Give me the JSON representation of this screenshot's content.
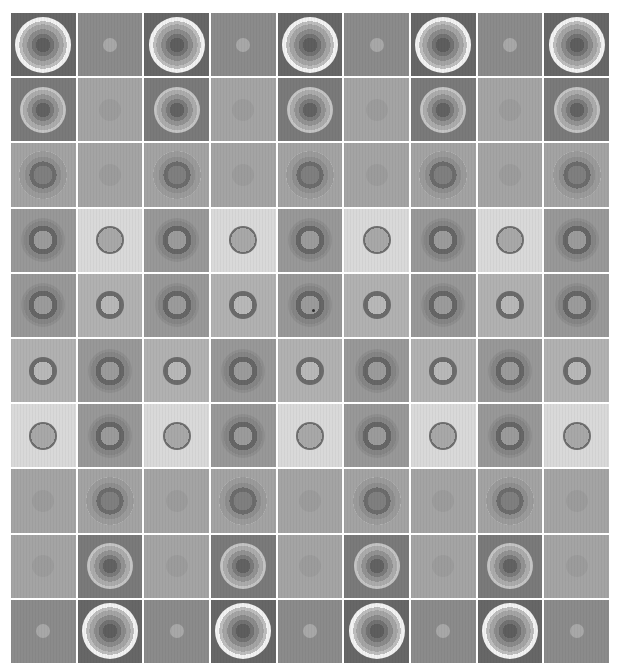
{
  "grid": {
    "columns": 9,
    "rows": 10,
    "description": "Grayscale concentric-circle stimulus sheet",
    "cell_types": {
      "big_ring": {
        "bg": "#676767",
        "size": 56,
        "gradient": "radial-gradient(circle, #5e5e5e 0 18%, #727272 18% 28%, #8a8a8a 28% 40%, #a4a4a4 40% 52%, #bdbdbd 52% 60%, #f2f2f2 60% 76%, #c6c6c6 76% 88%, #a9a9a9 88% 100%)"
      },
      "white_ring": {
        "bg": "#7a7a7a",
        "size": 46,
        "gradient": "radial-gradient(circle, #626262 0 22%, #7a7a7a 22% 34%, #929292 34% 48%, #ababab 48% 62%, #c4c4c4 62% 74%, #f4f4f4 74% 100%)"
      },
      "faint_halo_ring": {
        "bg": "#a3a3a3",
        "size": 48,
        "gradient": "radial-gradient(circle, #7f7f7f 0 28%, #6c6c6c 28% 40%, #8e8e8e 40% 54%, #9a9a9a 54% 70%, #bdbdbd 70% 82%, #acacac 82% 100%)"
      },
      "soft_halo_ring": {
        "bg": "#989898",
        "size": 44,
        "gradient": "radial-gradient(circle, #9b9b9b 0 30%, #666666 30% 46%, #858585 46% 62%, #8e8e8e 62% 80%, #949494 80% 100%)"
      },
      "light_bg_ring": {
        "bg": "#d9d9d9",
        "size": 28,
        "gradient": "radial-gradient(circle, #a8a8a8 0 60%, #6e6e6e 60% 100%)"
      },
      "mid_bg_ring": {
        "bg": "#b1b1b1",
        "size": 28,
        "gradient": "radial-gradient(circle, #b8b8b8 0 48%, #6b6b6b 48% 80%, #5e5e5e 80% 100%)"
      },
      "faint_striped_circle": {
        "bg": "#a4a4a4",
        "size": 22,
        "gradient": "radial-gradient(circle, #9c9c9c 0 80%, #949494 80% 100%)"
      },
      "small_dot": {
        "bg": "#8b8b8b",
        "size": 14,
        "gradient": "radial-gradient(circle, #a8a8a8 0 100%)"
      }
    },
    "rows_data": [
      [
        "big_ring",
        "small_dot",
        "big_ring",
        "small_dot",
        "big_ring",
        "small_dot",
        "big_ring",
        "small_dot",
        "big_ring"
      ],
      [
        "white_ring",
        "faint_striped_circle",
        "white_ring",
        "faint_striped_circle",
        "white_ring",
        "faint_striped_circle",
        "white_ring",
        "faint_striped_circle",
        "white_ring"
      ],
      [
        "faint_halo_ring",
        "faint_striped_circle",
        "faint_halo_ring",
        "faint_striped_circle",
        "faint_halo_ring",
        "faint_striped_circle",
        "faint_halo_ring",
        "faint_striped_circle",
        "faint_halo_ring"
      ],
      [
        "soft_halo_ring",
        "light_bg_ring",
        "soft_halo_ring",
        "light_bg_ring",
        "soft_halo_ring",
        "light_bg_ring",
        "soft_halo_ring",
        "light_bg_ring",
        "soft_halo_ring"
      ],
      [
        "soft_halo_ring",
        "mid_bg_ring",
        "soft_halo_ring",
        "mid_bg_ring",
        "soft_halo_ring",
        "mid_bg_ring",
        "soft_halo_ring",
        "mid_bg_ring",
        "soft_halo_ring"
      ],
      [
        "mid_bg_ring",
        "soft_halo_ring",
        "mid_bg_ring",
        "soft_halo_ring",
        "mid_bg_ring",
        "soft_halo_ring",
        "mid_bg_ring",
        "soft_halo_ring",
        "mid_bg_ring"
      ],
      [
        "light_bg_ring",
        "soft_halo_ring",
        "light_bg_ring",
        "soft_halo_ring",
        "light_bg_ring",
        "soft_halo_ring",
        "light_bg_ring",
        "soft_halo_ring",
        "light_bg_ring"
      ],
      [
        "faint_striped_circle",
        "faint_halo_ring",
        "faint_striped_circle",
        "faint_halo_ring",
        "faint_striped_circle",
        "faint_halo_ring",
        "faint_striped_circle",
        "faint_halo_ring",
        "faint_striped_circle"
      ],
      [
        "faint_striped_circle",
        "white_ring",
        "faint_striped_circle",
        "white_ring",
        "faint_striped_circle",
        "white_ring",
        "faint_striped_circle",
        "white_ring",
        "faint_striped_circle"
      ],
      [
        "small_dot",
        "big_ring",
        "small_dot",
        "big_ring",
        "small_dot",
        "big_ring",
        "small_dot",
        "big_ring",
        "small_dot"
      ]
    ],
    "center_marker": {
      "row": 4,
      "col": 4,
      "color": "#303030"
    },
    "gap_color": "#ffffff"
  }
}
